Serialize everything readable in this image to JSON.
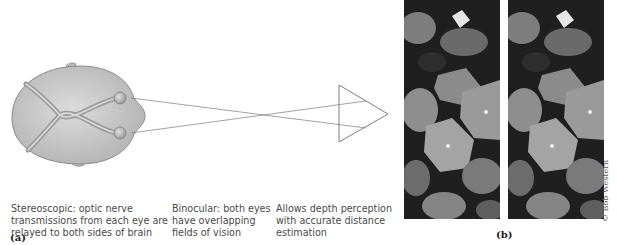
{
  "figure": {
    "panel_a": {
      "label": "(a)",
      "captions": [
        {
          "lines": [
            "Stereoscopic: optic nerve",
            "transmissions from each eye are",
            "relayed to both sides of brain"
          ]
        },
        {
          "lines": [
            "Binocular: both eyes",
            "have overlapping",
            "fields of vision"
          ]
        },
        {
          "lines": [
            "Allows depth perception",
            "with accurate distance",
            "estimation"
          ]
        }
      ],
      "elements": [
        "head-top-view",
        "left-eye",
        "right-eye",
        "optic-nerves",
        "crossing-sight-lines",
        "triangle-target"
      ]
    },
    "panel_b": {
      "label": "(b)",
      "description": "Stereo pair of leaf photographs",
      "credit": "© Bob Western"
    },
    "colors": {
      "head_fill": "#c9c9c9",
      "head_stroke": "#8a8a8a",
      "line": "#777777",
      "photo_dark": "#1e1e1e",
      "leaf_light": "#9a9a9a"
    }
  }
}
